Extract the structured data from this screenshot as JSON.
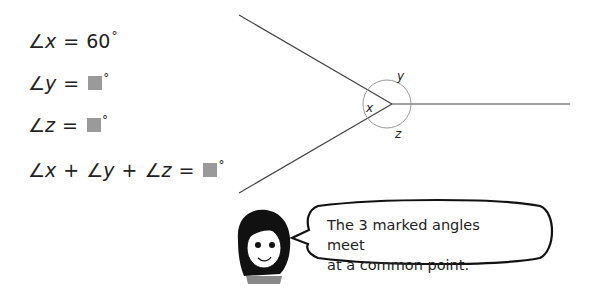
{
  "equations": [
    {
      "angle": "x",
      "value": "60",
      "blank": false,
      "degree": "°"
    },
    {
      "angle": "y",
      "value": "",
      "blank": true,
      "degree": "°"
    },
    {
      "angle": "z",
      "value": "",
      "blank": true,
      "degree": "°"
    }
  ],
  "sum_equation": {
    "terms": [
      "x",
      "y",
      "z"
    ],
    "blank": true,
    "degree": "°"
  },
  "diagram": {
    "labels": {
      "x": "x",
      "y": "y",
      "z": "z"
    },
    "given_angle_x": 60
  },
  "speech_bubble": {
    "line1": "The 3 marked angles meet",
    "line2": "at a common point."
  },
  "symbols": {
    "angle": "∠",
    "equals": "=",
    "plus": "+"
  }
}
